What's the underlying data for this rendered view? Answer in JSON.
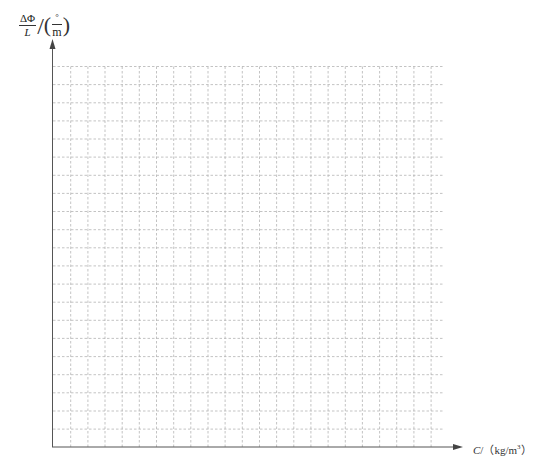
{
  "chart_data": {
    "type": "scatter",
    "title": "",
    "subtitle": "",
    "ylabel": {
      "quantity_numerator": "ΔΦ",
      "quantity_denominator": "L",
      "unit_numerator": "°",
      "unit_denominator": "m",
      "full": "ΔΦ/L /(°/m)"
    },
    "xlabel": {
      "variable": "C",
      "unit_open": "/（kg/m",
      "unit_sup": "3",
      "unit_close": "）",
      "full": "C/（kg/m³）"
    },
    "series": [],
    "x": [],
    "values": [],
    "grid": {
      "on": true,
      "style": "dashed",
      "vertical_lines": 22,
      "horizontal_lines": 21
    },
    "tick_labels": {
      "x": [],
      "y": []
    },
    "legend": null
  },
  "colors": {
    "axis": "#555555",
    "grid": "#b4b4b4",
    "text": "#222222",
    "background": "#ffffff"
  }
}
